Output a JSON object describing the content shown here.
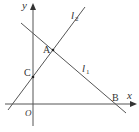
{
  "diagram": {
    "type": "coordinate-geometry",
    "axes": {
      "x_label": "x",
      "y_label": "y",
      "origin_label": "O"
    },
    "lines": [
      {
        "name": "l1",
        "label": "l",
        "subscript": "1",
        "description": "line through A and B with negative slope"
      },
      {
        "name": "l2",
        "label": "l",
        "subscript": "2",
        "description": "line through C and A with positive slope"
      }
    ],
    "points": [
      {
        "name": "A",
        "label": "A",
        "description": "intersection of l1 and l2"
      },
      {
        "name": "B",
        "label": "B",
        "description": "intersection of l1 with x-axis"
      },
      {
        "name": "C",
        "label": "C",
        "description": "intersection of l2 with y-axis"
      }
    ],
    "colors": {
      "line": "#555555",
      "text": "#333333",
      "background": "#ffffff"
    }
  }
}
